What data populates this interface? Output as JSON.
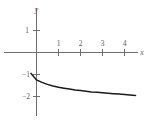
{
  "chart_data": {
    "type": "line",
    "title": "",
    "subtitle": "",
    "xlabel": "x",
    "ylabel": "y",
    "grid": false,
    "legend": null,
    "xlim": [
      -0.3,
      4.8
    ],
    "ylim": [
      -2.4,
      1.5
    ],
    "xticks": [
      1,
      2,
      3,
      4
    ],
    "xtick_labels": [
      "1",
      "2",
      "3",
      "4"
    ],
    "yticks": [
      1,
      -1,
      -2
    ],
    "ytick_labels": [
      "1",
      "−1",
      "−2"
    ],
    "series": [
      {
        "name": "curve",
        "color": "#1a1a1a",
        "x": [
          -0.25,
          0.0,
          0.25,
          0.5,
          0.75,
          1.0,
          1.25,
          1.5,
          1.75,
          2.0,
          2.25,
          2.5,
          2.75,
          3.0,
          3.25,
          3.5,
          3.75,
          4.0,
          4.25,
          4.5
        ],
        "y": [
          -0.95,
          -1.25,
          -1.36,
          -1.45,
          -1.52,
          -1.58,
          -1.62,
          -1.66,
          -1.7,
          -1.73,
          -1.76,
          -1.79,
          -1.81,
          -1.83,
          -1.85,
          -1.87,
          -1.89,
          -1.91,
          -1.93,
          -1.95
        ]
      }
    ],
    "annotations": []
  },
  "axes": {
    "x_axis_label": "x",
    "y_axis_label": "y"
  },
  "ticks": {
    "x": [
      {
        "label": "1",
        "value": 1
      },
      {
        "label": "2",
        "value": 2
      },
      {
        "label": "3",
        "value": 3
      },
      {
        "label": "4",
        "value": 4
      }
    ],
    "y": [
      {
        "label": "1",
        "value": 1
      },
      {
        "label": "−1",
        "value": -1
      },
      {
        "label": "−2",
        "value": -2
      }
    ]
  },
  "colors": {
    "axis": "#6e6e6e",
    "curve": "#1a1a1a",
    "text": "#5a5a5a",
    "background": "#ffffff"
  }
}
